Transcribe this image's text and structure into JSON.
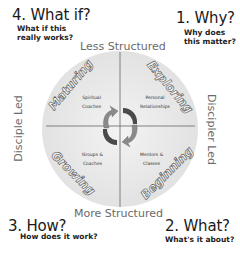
{
  "corners": {
    "top_left": {
      "title": "4. What if?",
      "subtitle_line1": "What if this",
      "subtitle_line2": "really works?"
    },
    "top_right": {
      "title": "1. Why?",
      "subtitle_line1": "Why does",
      "subtitle_line2": "this matter?"
    },
    "bottom_left": {
      "title": "3. How?",
      "subtitle_line1": "How does it work?"
    },
    "bottom_right": {
      "title": "2. What?",
      "subtitle_line1": "What's it about?"
    }
  },
  "axes": {
    "top": "Less Structured",
    "bottom": "More Structured",
    "left": "Disciple Led",
    "right": "Discipler Led"
  },
  "quadrants": {
    "top_left": {
      "label": "Maturing",
      "inner_line1": "Spiritual",
      "inner_line2": "Coaches"
    },
    "top_right": {
      "label": "Exploring",
      "inner_line1": "Personal",
      "inner_line2": "Relationships"
    },
    "bottom_left": {
      "label": "Growing",
      "inner_line1": "Groups &",
      "inner_line2": "Coaches"
    },
    "bottom_right": {
      "label": "Beginning",
      "inner_line1": "Mentors &",
      "inner_line2": "Classes"
    }
  },
  "center": {
    "icon": "cycle-arrows-icon"
  },
  "colors": {
    "circle_fill": "#e6e6e6",
    "axis_line": "#555555",
    "arrow_top_left": "#8a8a8a",
    "arrow_top_right": "#4a4a4a",
    "arrow_bottom_left": "#4a4a4a",
    "arrow_bottom_right": "#8a8a8a"
  }
}
